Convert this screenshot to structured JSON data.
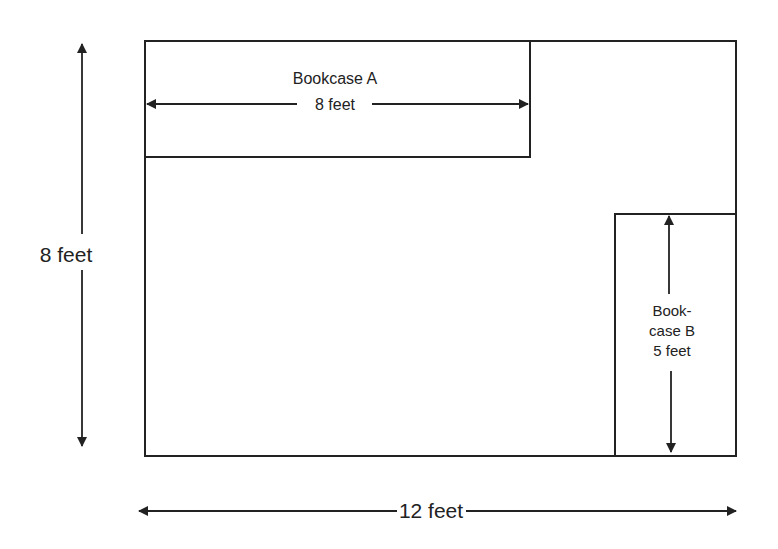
{
  "diagram": {
    "room": {
      "width_label": "12 feet",
      "height_label": "8 feet"
    },
    "bookcase_a": {
      "name": "Bookcase A",
      "length_label": "8 feet"
    },
    "bookcase_b": {
      "name_line1": "Book-",
      "name_line2": "case B",
      "length_label": "5 feet"
    },
    "colors": {
      "stroke": "#222222",
      "background": "#ffffff"
    }
  }
}
